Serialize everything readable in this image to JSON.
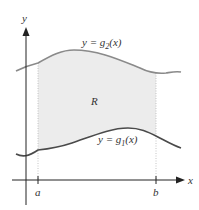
{
  "figure": {
    "axes": {
      "x_label": "x",
      "y_label": "y"
    },
    "ticks": {
      "a": "a",
      "b": "b"
    },
    "curves": {
      "upper": {
        "name": "g2",
        "label_lhs": "y = g",
        "label_sub": "2",
        "label_rhs": "(x)",
        "color": "#8a8a8a"
      },
      "lower": {
        "name": "g1",
        "label_lhs": "y = g",
        "label_sub": "1",
        "label_rhs": "(x)",
        "color": "#4a4a4a"
      }
    },
    "region": {
      "label": "R",
      "fill_color": "#ececec"
    },
    "colors": {
      "axis": "#222222",
      "guide": "#b5b5b5",
      "text": "#333333"
    }
  }
}
